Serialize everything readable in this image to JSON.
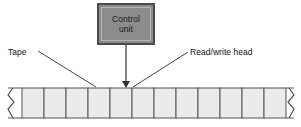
{
  "figure": {
    "background_color": "#ffffff"
  },
  "control_unit": {
    "label": "Control\nunit",
    "fill_color": "#8c8c8c",
    "border_color": "#4a4a4a",
    "inner_border_color": "#b4b4b4",
    "text_color": "#1a1a1a"
  },
  "callouts": {
    "tape": {
      "label": "Tape"
    },
    "head": {
      "label": "Read/write head"
    }
  },
  "tape": {
    "cell_count": 12,
    "cell_fill_color": "#ebebeb",
    "border_color": "#555555",
    "left_end": "torn-edge-zigzag",
    "right_end": "torn-edge-zigzag"
  },
  "arrow": {
    "label": "control-unit-to-head-arrow",
    "color": "#333333",
    "direction": "down"
  },
  "leader_lines": {
    "tape_leader": "#444444",
    "head_leader": "#444444"
  }
}
